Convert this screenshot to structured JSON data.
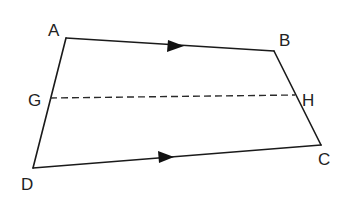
{
  "diagram": {
    "type": "trapezium",
    "colors": {
      "line": "#1a1a1a",
      "label": "#222222",
      "background": "#ffffff"
    },
    "vertices": {
      "A": {
        "label": "A",
        "x": 66,
        "y": 38,
        "label_x": 48,
        "label_y": 36
      },
      "B": {
        "label": "B",
        "x": 274,
        "y": 51,
        "label_x": 279,
        "label_y": 46
      },
      "C": {
        "label": "C",
        "x": 321,
        "y": 145,
        "label_x": 318,
        "label_y": 165
      },
      "D": {
        "label": "D",
        "x": 33,
        "y": 168,
        "label_x": 21,
        "label_y": 190
      },
      "G": {
        "label": "G",
        "x": 50,
        "y": 98,
        "label_x": 28,
        "label_y": 106
      },
      "H": {
        "label": "H",
        "x": 295,
        "y": 96,
        "label_x": 302,
        "label_y": 106
      }
    },
    "edges": [
      {
        "from": "A",
        "to": "B",
        "style": "solid",
        "parallel_arrow": true
      },
      {
        "from": "B",
        "to": "C",
        "style": "solid",
        "parallel_arrow": false
      },
      {
        "from": "D",
        "to": "C",
        "style": "solid",
        "parallel_arrow": true
      },
      {
        "from": "A",
        "to": "D",
        "style": "solid",
        "parallel_arrow": false
      },
      {
        "from": "G",
        "to": "H",
        "style": "dashed",
        "parallel_arrow": false
      }
    ],
    "labels": [
      "A",
      "B",
      "C",
      "D",
      "G",
      "H"
    ]
  }
}
